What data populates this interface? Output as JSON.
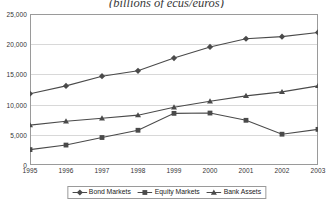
{
  "chart_data": {
    "type": "line",
    "title": "(billions of ecus/euros)",
    "xlabel": "",
    "ylabel": "",
    "categories": [
      "1995",
      "1996",
      "1997",
      "1998",
      "1999",
      "2000",
      "2001",
      "2002",
      "2003"
    ],
    "x_tick_labels": [
      "1995",
      "1996",
      "1997",
      "1998",
      "1999",
      "2000",
      "2001",
      "2002",
      "2003"
    ],
    "y_tick_labels": [
      "0",
      "5,000",
      "10,000",
      "15,000",
      "20,000",
      "25,000"
    ],
    "y_tick_values": [
      0,
      5000,
      10000,
      15000,
      20000,
      25000
    ],
    "ylim": [
      0,
      25000
    ],
    "grid": true,
    "legend_position": "bottom",
    "series": [
      {
        "name": "Bond Markets",
        "marker": "diamond",
        "color": "#4a4a4a",
        "values": [
          11800,
          13100,
          14700,
          15600,
          17700,
          19550,
          20900,
          21250,
          21950
        ]
      },
      {
        "name": "Equity Markets",
        "marker": "square",
        "color": "#4a4a4a",
        "values": [
          2550,
          3300,
          4550,
          5750,
          8550,
          8600,
          7400,
          5100,
          5900
        ]
      },
      {
        "name": "Bank Assets",
        "marker": "triangle",
        "color": "#4a4a4a",
        "values": [
          6600,
          7250,
          7750,
          8250,
          9550,
          10550,
          11450,
          12100,
          13100
        ]
      }
    ]
  },
  "legend": {
    "items": [
      {
        "label": "Bond Markets"
      },
      {
        "label": "Equity Markets"
      },
      {
        "label": "Bank Assets"
      }
    ]
  },
  "colors": {
    "series_line": "#4a4a4a",
    "gridline": "#d8d8d8",
    "frame": "#9a9a9a",
    "text": "#333333"
  }
}
